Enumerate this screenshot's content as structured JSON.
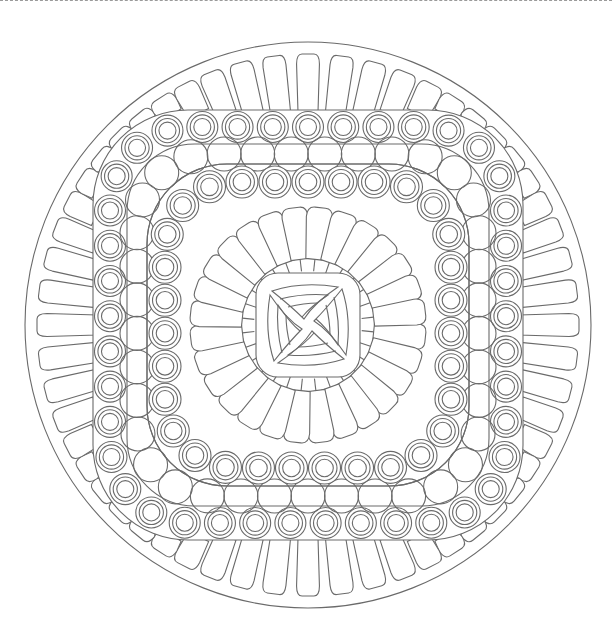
{
  "page": {
    "type": "coloring-page",
    "line_color": "#6a6a6a",
    "background": "#ffffff",
    "top_border": "dashed"
  },
  "mandala": {
    "center": [
      308,
      325
    ],
    "outer_circle_radius": 283,
    "outer_petal_count": 56,
    "outer_band": {
      "half": 215,
      "width": 34,
      "corner_radius": 95,
      "ring_circle_spacing": 35
    },
    "scallop_band": {
      "half": 161,
      "corner_radius": 80
    },
    "inner_ring": {
      "half": 143,
      "corner_radius": 70,
      "circle_spacing": 33.5,
      "circle_radius": 16
    },
    "inner_petal_count": 28,
    "center_square": {
      "half": 52,
      "corner_radius": 22,
      "swirl_arms": 4
    }
  }
}
